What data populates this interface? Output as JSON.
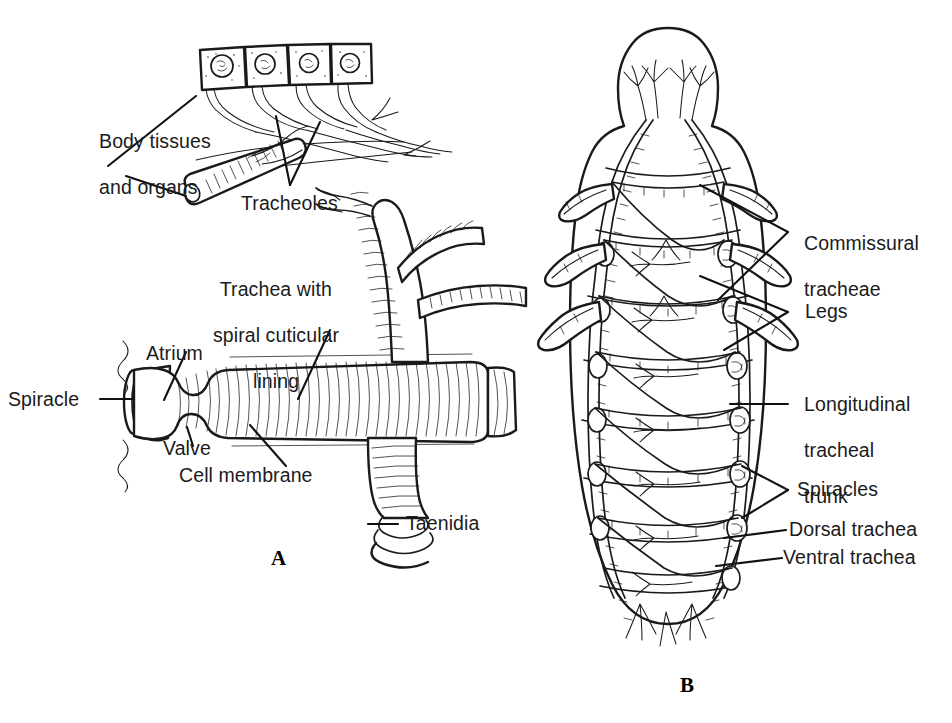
{
  "figure": {
    "background_color": "#ffffff",
    "ink_color": "#1a1a1a",
    "panels": [
      {
        "letter": "A",
        "name": "detail-of-trachea-and-tracheoles",
        "labels": [
          "Body tissues and organs",
          "Tracheoles",
          "Trachea with spiral cuticular lining",
          "Atrium",
          "Spiracle",
          "Valve",
          "Cell membrane",
          "Taenidia"
        ]
      },
      {
        "letter": "B",
        "name": "whole-insect-tracheal-network",
        "labels": [
          "Commissural tracheae",
          "Legs",
          "Longitudinal tracheal trunk",
          "Spiracles",
          "Dorsal trachea",
          "Ventral trachea"
        ]
      }
    ]
  },
  "panel_a": {
    "letter": "A",
    "labels": {
      "body_tissues_line1": "Body tissues",
      "body_tissues_line2": "and organs",
      "tracheoles": "Tracheoles",
      "trachea_line1": "Trachea with",
      "trachea_line2": "spiral cuticular",
      "trachea_line3": "lining",
      "atrium": "Atrium",
      "spiracle": "Spiracle",
      "valve": "Valve",
      "cell_membrane": "Cell membrane",
      "taenidia": "Taenidia"
    }
  },
  "panel_b": {
    "letter": "B",
    "labels": {
      "commissural_line1": "Commissural",
      "commissural_line2": "tracheae",
      "legs": "Legs",
      "longitudinal_line1": "Longitudinal",
      "longitudinal_line2": "tracheal",
      "longitudinal_line3": "trunk",
      "spiracles": "Spiracles",
      "dorsal_trachea": "Dorsal trachea",
      "ventral_trachea": "Ventral trachea"
    }
  }
}
